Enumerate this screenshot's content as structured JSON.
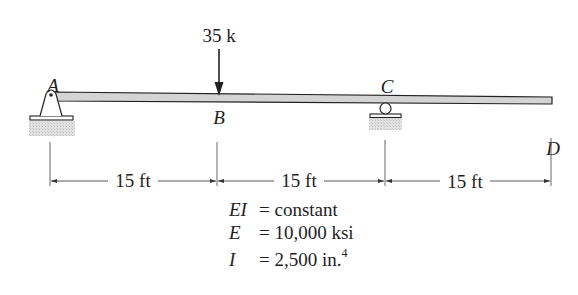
{
  "diagram": {
    "type": "beam",
    "load": {
      "label": "35 k",
      "point": "B",
      "direction": "down"
    },
    "points": [
      {
        "id": "A",
        "label": "A",
        "support": "pin"
      },
      {
        "id": "B",
        "label": "B",
        "support": "none"
      },
      {
        "id": "C",
        "label": "C",
        "support": "roller"
      },
      {
        "id": "D",
        "label": "D",
        "support": "free end"
      }
    ],
    "spans": [
      {
        "from": "A",
        "to": "B",
        "label": "15 ft"
      },
      {
        "from": "B",
        "to": "C",
        "label": "15 ft"
      },
      {
        "from": "C",
        "to": "D",
        "label": "15 ft"
      }
    ],
    "properties": [
      {
        "symbol": "EI",
        "value": "= constant"
      },
      {
        "symbol": "E",
        "value": "= 10,000 ksi"
      },
      {
        "symbol": "I",
        "value": "= 2,500 in.",
        "superscript": "4"
      }
    ]
  },
  "colors": {
    "beam_fill": "#d4d4d4",
    "line": "#222222",
    "ground_hatch": "#cfcfcf"
  }
}
